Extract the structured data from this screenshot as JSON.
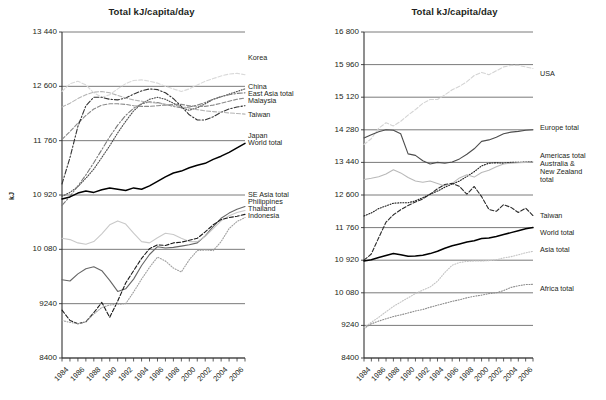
{
  "charts": [
    {
      "id": "left",
      "title": "Total kJ/capita/day",
      "ylabel": "kJ",
      "yticks": [
        "8400",
        "9240",
        "10 080",
        "10 920",
        "11 760",
        "12 600",
        "13 440"
      ],
      "xticks": [
        "1984",
        "1986",
        "1988",
        "1990",
        "1992",
        "1994",
        "1996",
        "1998",
        "2000",
        "2002",
        "2004",
        "2006"
      ],
      "labels": [
        {
          "text": "Korea",
          "x": 248,
          "y": 54
        },
        {
          "text": "China",
          "x": 248,
          "y": 83
        },
        {
          "text": "East Asia total",
          "x": 248,
          "y": 90
        },
        {
          "text": "Malaysia",
          "x": 248,
          "y": 97
        },
        {
          "text": "Taiwan",
          "x": 248,
          "y": 111
        },
        {
          "text": "Japan",
          "x": 248,
          "y": 132
        },
        {
          "text": "World total",
          "x": 248,
          "y": 139
        },
        {
          "text": "SE Asia total",
          "x": 248,
          "y": 191
        },
        {
          "text": "Philippines",
          "x": 248,
          "y": 198
        },
        {
          "text": "Thailand",
          "x": 248,
          "y": 205
        },
        {
          "text": "Indonesia",
          "x": 248,
          "y": 212
        }
      ]
    },
    {
      "id": "right",
      "title": "Total kJ/capita/day",
      "ylabel": "kJ",
      "yticks": [
        "8400",
        "9240",
        "10 080",
        "10 920",
        "11 760",
        "12 600",
        "13 440",
        "14 280",
        "15 120",
        "15 960",
        "16 800"
      ],
      "xticks": [
        "1984",
        "1986",
        "1988",
        "1990",
        "1992",
        "1994",
        "1996",
        "1998",
        "2000",
        "2002",
        "2004",
        "2006"
      ],
      "labels": [
        {
          "text": "Americas total",
          "x": 540,
          "y": 152
        },
        {
          "text": "Australia &",
          "x": 540,
          "y": 160
        },
        {
          "text": "New Zealand",
          "x": 540,
          "y": 168
        },
        {
          "text": "total",
          "x": 540,
          "y": 176
        },
        {
          "text": "USA",
          "x": 540,
          "y": 70
        },
        {
          "text": "Europe total",
          "x": 540,
          "y": 124
        },
        {
          "text": "Taiwan",
          "x": 540,
          "y": 212
        },
        {
          "text": "World total",
          "x": 540,
          "y": 229
        },
        {
          "text": "Asia total",
          "x": 540,
          "y": 246
        },
        {
          "text": "Africa total",
          "x": 540,
          "y": 285
        }
      ]
    }
  ],
  "chart_data": [
    {
      "type": "line",
      "panel": "left",
      "title": "Total kJ/capita/day",
      "xlabel": "",
      "ylabel": "kJ",
      "ylim": [
        8400,
        13440
      ],
      "xlim": [
        1984,
        2007
      ],
      "grid": true,
      "legend_position": "right-inline-labels",
      "x": [
        1984,
        1985,
        1986,
        1987,
        1988,
        1989,
        1990,
        1991,
        1992,
        1993,
        1994,
        1995,
        1996,
        1997,
        1998,
        1999,
        2000,
        2001,
        2002,
        2003,
        2004,
        2005,
        2006,
        2007
      ],
      "series": [
        {
          "name": "Korea",
          "color": "#d9d9d9",
          "style": "dashed",
          "values": [
            12520,
            12640,
            12680,
            12620,
            12500,
            12430,
            12470,
            12560,
            12640,
            12690,
            12700,
            12680,
            12650,
            12600,
            12560,
            12520,
            12560,
            12620,
            12680,
            12720,
            12760,
            12790,
            12800,
            12780
          ]
        },
        {
          "name": "China",
          "color": "#4a4a4a",
          "style": "dotted",
          "values": [
            10900,
            10960,
            11050,
            11180,
            11320,
            11500,
            11680,
            11880,
            12060,
            12220,
            12330,
            12400,
            12430,
            12400,
            12340,
            12270,
            12230,
            12270,
            12330,
            12400,
            12440,
            12480,
            12520,
            12560
          ]
        },
        {
          "name": "East Asia total",
          "color": "#7a7a7a",
          "style": "dashdot",
          "values": [
            10760,
            10900,
            11060,
            11230,
            11420,
            11620,
            11820,
            12000,
            12150,
            12260,
            12330,
            12360,
            12350,
            12320,
            12290,
            12270,
            12280,
            12310,
            12350,
            12400,
            12440,
            12470,
            12490,
            12500
          ]
        },
        {
          "name": "Malaysia",
          "color": "#8a8a8a",
          "style": "dashed",
          "values": [
            11780,
            11900,
            12030,
            12150,
            12250,
            12310,
            12330,
            12330,
            12320,
            12300,
            12290,
            12290,
            12300,
            12310,
            12320,
            12320,
            12300,
            12290,
            12290,
            12310,
            12340,
            12370,
            12400,
            12420
          ]
        },
        {
          "name": "Taiwan",
          "color": "#333333",
          "style": "dashdot",
          "values": [
            11090,
            11500,
            11980,
            12300,
            12430,
            12430,
            12400,
            12390,
            12420,
            12480,
            12530,
            12560,
            12550,
            12500,
            12410,
            12290,
            12160,
            12080,
            12080,
            12130,
            12200,
            12250,
            12280,
            12300
          ]
        },
        {
          "name": "Japan",
          "color": "#b5b5b5",
          "style": "dashed",
          "values": [
            12280,
            12340,
            12410,
            12470,
            12510,
            12520,
            12500,
            12460,
            12420,
            12390,
            12370,
            12350,
            12340,
            12320,
            12300,
            12280,
            12260,
            12240,
            12220,
            12210,
            12200,
            12190,
            12180,
            12170
          ]
        },
        {
          "name": "World total",
          "color": "#000000",
          "style": "solid",
          "values": [
            10860,
            10890,
            10950,
            10980,
            10960,
            11000,
            11030,
            11010,
            10990,
            11030,
            11010,
            11060,
            11130,
            11200,
            11260,
            11290,
            11340,
            11380,
            11410,
            11470,
            11520,
            11580,
            11650,
            11720
          ]
        },
        {
          "name": "SE Asia total",
          "color": "#666666",
          "style": "solid",
          "values": [
            9610,
            9590,
            9700,
            9780,
            9810,
            9750,
            9600,
            9430,
            9470,
            9620,
            9830,
            10000,
            10120,
            10100,
            10110,
            10130,
            10150,
            10180,
            10290,
            10430,
            10560,
            10640,
            10700,
            10740
          ]
        },
        {
          "name": "Philippines",
          "color": "#c9c9c9",
          "style": "solid",
          "values": [
            10250,
            10230,
            10180,
            10160,
            10200,
            10320,
            10460,
            10520,
            10470,
            10330,
            10200,
            10180,
            10260,
            10330,
            10310,
            10250,
            10200,
            10200,
            10280,
            10400,
            10520,
            10600,
            10650,
            10680
          ]
        },
        {
          "name": "Thailand",
          "color": "#1a1a1a",
          "style": "dashed",
          "values": [
            9140,
            8980,
            8930,
            8960,
            9100,
            9260,
            9030,
            9280,
            9560,
            9750,
            9940,
            10090,
            10150,
            10140,
            10180,
            10190,
            10220,
            10250,
            10350,
            10460,
            10540,
            10570,
            10590,
            10620
          ]
        },
        {
          "name": "Indonesia",
          "color": "#a0a0a0",
          "style": "dotted",
          "values": [
            8980,
            8950,
            8930,
            8960,
            9080,
            9180,
            9220,
            9230,
            9240,
            9420,
            9620,
            9800,
            9960,
            9900,
            9790,
            9730,
            9920,
            10060,
            10070,
            10060,
            10200,
            10400,
            10510,
            10570
          ]
        }
      ]
    },
    {
      "type": "line",
      "panel": "right",
      "title": "Total kJ/capita/day",
      "xlabel": "",
      "ylabel": "kJ",
      "ylim": [
        8400,
        16800
      ],
      "xlim": [
        1984,
        2007
      ],
      "grid": true,
      "legend_position": "right-inline-labels",
      "x": [
        1984,
        1985,
        1986,
        1987,
        1988,
        1989,
        1990,
        1991,
        1992,
        1993,
        1994,
        1995,
        1996,
        1997,
        1998,
        1999,
        2000,
        2001,
        2002,
        2003,
        2004,
        2005,
        2006,
        2007
      ],
      "series": [
        {
          "name": "USA",
          "color": "#d4d4d4",
          "style": "dashed",
          "values": [
            13900,
            14050,
            14320,
            14460,
            14380,
            14500,
            14660,
            14800,
            14960,
            15060,
            15060,
            15180,
            15310,
            15400,
            15520,
            15680,
            15760,
            15700,
            15800,
            15900,
            15940,
            15940,
            15900,
            15860
          ]
        },
        {
          "name": "Europe total",
          "color": "#4d4d4d",
          "style": "solid",
          "values": [
            14070,
            14150,
            14230,
            14280,
            14270,
            14180,
            13660,
            13620,
            13480,
            13400,
            13440,
            13420,
            13450,
            13530,
            13650,
            13790,
            13980,
            14020,
            14090,
            14180,
            14220,
            14240,
            14270,
            14280
          ]
        },
        {
          "name": "Americas total",
          "color": "#1f1f1f",
          "style": "dotted",
          "values": [
            12060,
            12140,
            12250,
            12320,
            12390,
            12400,
            12400,
            12450,
            12530,
            12620,
            12700,
            12800,
            12880,
            12960,
            13080,
            13200,
            13350,
            13420,
            13430,
            13420,
            13440,
            13440,
            13450,
            13460
          ]
        },
        {
          "name": "Australia & New Zealand total",
          "color": "#b9b9b9",
          "style": "solid",
          "values": [
            13000,
            13030,
            13070,
            13140,
            13250,
            13170,
            13050,
            12960,
            12930,
            12960,
            12900,
            12830,
            12900,
            13040,
            13120,
            13060,
            13180,
            13240,
            13330,
            13400,
            13420,
            13430,
            13440,
            13450
          ]
        },
        {
          "name": "Taiwan",
          "color": "#2b2b2b",
          "style": "dashed",
          "values": [
            10920,
            11080,
            11500,
            11900,
            12090,
            12220,
            12330,
            12420,
            12500,
            12620,
            12760,
            12870,
            12900,
            12820,
            12620,
            12820,
            12560,
            12230,
            12180,
            12350,
            12280,
            12150,
            12260,
            12070
          ]
        },
        {
          "name": "World total",
          "color": "#000000",
          "style": "solid",
          "values": [
            10900,
            10930,
            10990,
            11040,
            11090,
            11060,
            11020,
            11030,
            11050,
            11090,
            11150,
            11230,
            11290,
            11340,
            11390,
            11420,
            11480,
            11490,
            11530,
            11580,
            11630,
            11680,
            11730,
            11760
          ]
        },
        {
          "name": "Asia total",
          "color": "#c4c4c4",
          "style": "dotted",
          "values": [
            9180,
            9320,
            9450,
            9590,
            9730,
            9840,
            9950,
            10060,
            10150,
            10230,
            10380,
            10600,
            10790,
            10860,
            10890,
            10900,
            10900,
            10910,
            10930,
            10980,
            11010,
            11060,
            11110,
            11150
          ]
        },
        {
          "name": "Africa total",
          "color": "#8c8c8c",
          "style": "dotted",
          "values": [
            9160,
            9280,
            9350,
            9410,
            9470,
            9510,
            9560,
            9610,
            9650,
            9710,
            9760,
            9810,
            9860,
            9900,
            9950,
            9990,
            10020,
            10060,
            10080,
            10140,
            10220,
            10260,
            10290,
            10300
          ]
        }
      ]
    }
  ]
}
